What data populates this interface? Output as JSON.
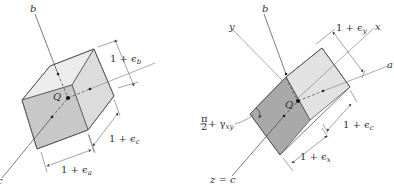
{
  "figure": {
    "left_panel": {
      "axis_labels": {
        "b": "b",
        "c": "c"
      },
      "origin_label": "Q",
      "dimensions": {
        "eps_b": "1 + ϵ",
        "eps_b_sub": "b",
        "eps_c": "1 + ϵ",
        "eps_c_sub": "c",
        "eps_a": "1 + ϵ",
        "eps_a_sub": "a"
      },
      "colors": {
        "top_face": "#ececec",
        "right_face": "#dcdcdc",
        "front_face": "#c8c8c8"
      }
    },
    "right_panel": {
      "axis_labels": {
        "b": "b",
        "y": "y",
        "x": "x",
        "a": "a",
        "z_eq_c": "z = c"
      },
      "origin_label": "Q",
      "angle_label": {
        "frac_num": "π",
        "frac_den": "2",
        "rest": "+ γ",
        "sub": "xy"
      },
      "dimensions": {
        "eps_y": "1 + ϵ",
        "eps_y_sub": "y",
        "eps_c": "1 + ϵ",
        "eps_c_sub": "c",
        "eps_x": "1 + ϵ",
        "eps_x_sub": "x"
      },
      "colors": {
        "light_face": "#e2e2e2",
        "dark_face": "#a9a9a9"
      }
    }
  }
}
